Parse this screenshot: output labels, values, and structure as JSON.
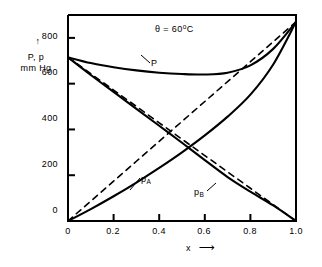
{
  "figure": {
    "name": "vapour-pressure-composition-diagram",
    "annotation": "θ = 60",
    "annotation_unit": "o",
    "annotation_unit_tail": "C"
  },
  "axes": {
    "y": {
      "label_line1": "P, p",
      "label_line2": "mm Hg",
      "arrow": "↑",
      "ticks": [
        "0",
        "200",
        "400",
        "600",
        "800"
      ],
      "tick_values": [
        0,
        200,
        400,
        600,
        800
      ],
      "min": 0,
      "max": 900
    },
    "x": {
      "label": "x",
      "arrow": "⟶",
      "ticks": [
        "0",
        "0.2",
        "0.4",
        "0.6",
        "0.8",
        "1.0"
      ],
      "tick_values": [
        0,
        0.2,
        0.4,
        0.6,
        0.8,
        1.0
      ],
      "min": 0,
      "max": 1.0
    }
  },
  "curve_labels": {
    "total": "P",
    "partial_a_base": "p",
    "partial_a_sub": "A",
    "partial_b_base": "p",
    "partial_b_sub": "B"
  },
  "colors": {
    "ink": "#000000",
    "background": "#ffffff"
  },
  "chart_data": {
    "type": "line",
    "xlabel": "x",
    "ylabel": "P, p  mm Hg",
    "xlim": [
      0,
      1.0
    ],
    "ylim": [
      0,
      900
    ],
    "grid": false,
    "legend": "inline-curve-labels",
    "x": [
      0,
      0.1,
      0.2,
      0.3,
      0.4,
      0.5,
      0.6,
      0.7,
      0.8,
      0.9,
      1.0
    ],
    "series": [
      {
        "name": "P",
        "label": "P",
        "style": "solid",
        "description": "total vapour pressure, positive deviation with minimum near x=0.6",
        "values": [
          715,
          690,
          672,
          658,
          648,
          642,
          640,
          648,
          680,
          752,
          870
        ]
      },
      {
        "name": "p_A",
        "label": "pA",
        "style": "solid",
        "description": "partial pressure of A, rises from 0 at x=0 to 870 at x=1.0, positive deviation",
        "values": [
          0,
          52,
          108,
          168,
          232,
          300,
          374,
          456,
          552,
          684,
          870
        ]
      },
      {
        "name": "p_B",
        "label": "pB",
        "style": "solid",
        "description": "partial pressure of B, falls from 715 at x=0 to 0 at x=1.0, positive deviation",
        "values": [
          715,
          638,
          564,
          490,
          416,
          342,
          266,
          192,
          128,
          68,
          0
        ]
      },
      {
        "name": "Raoult_A",
        "label": "Raoult line for A",
        "style": "dashed",
        "description": "ideal Raoult's law straight line for A",
        "values": [
          0,
          87,
          174,
          261,
          348,
          435,
          522,
          609,
          696,
          783,
          870
        ]
      },
      {
        "name": "Raoult_B",
        "label": "Raoult line for B",
        "style": "dashed",
        "description": "ideal Raoult's law straight line for B",
        "values": [
          715,
          643.5,
          572,
          500.5,
          429,
          357.5,
          286,
          214.5,
          143,
          71.5,
          0
        ]
      }
    ]
  }
}
